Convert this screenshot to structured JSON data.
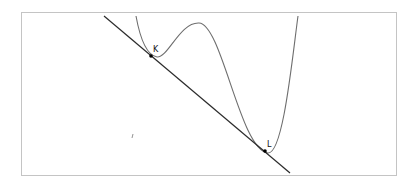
{
  "diagram": {
    "type": "function-graph-with-double-tangent",
    "colors": {
      "curve": "#6e6e6e",
      "line": "#2b2b2b",
      "point": "#000000",
      "frame": "#c4c4c4"
    },
    "points": [
      {
        "id": "K",
        "label": "K",
        "x": 151,
        "y": 56
      },
      {
        "id": "L",
        "label": "L",
        "x": 265,
        "y": 151
      }
    ],
    "line": {
      "x1": 104,
      "y1": 16,
      "x2": 290,
      "y2": 173
    },
    "curve_path": "M136,16 C140,38 146,55 157,57 C168,58 180,22 199,23 C222,24 240,150 268,153 C283,154 292,60 298,16",
    "stray_mark": {
      "x": 132,
      "y": 136
    }
  }
}
